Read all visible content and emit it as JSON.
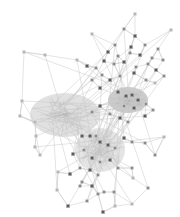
{
  "diagram": {
    "type": "network-graph",
    "background": "#ffffff",
    "edge_color": "#c8c8c8",
    "node_dark": "#5a5a5a",
    "node_mid": "#8a8a8a",
    "node_light": "#b4b4b4",
    "hub_clusters": [
      {
        "name": "left-dense",
        "cx": 65,
        "cy": 115,
        "rx": 35,
        "ry": 22,
        "shade": "#bdbdbd"
      },
      {
        "name": "right-dense",
        "cx": 128,
        "cy": 100,
        "rx": 20,
        "ry": 13,
        "shade": "#8f8f8f"
      },
      {
        "name": "bottom-dense",
        "cx": 100,
        "cy": 150,
        "rx": 25,
        "ry": 22,
        "shade": "#c4c4c4"
      }
    ],
    "nodes": [
      [
        135,
        14,
        "l"
      ],
      [
        124,
        29,
        "m"
      ],
      [
        135,
        36,
        "d"
      ],
      [
        171,
        30,
        "l"
      ],
      [
        92,
        34,
        "l"
      ],
      [
        115,
        45,
        "m"
      ],
      [
        131,
        47,
        "d"
      ],
      [
        145,
        45,
        "m"
      ],
      [
        158,
        49,
        "m"
      ],
      [
        108,
        52,
        "d"
      ],
      [
        118,
        56,
        "m"
      ],
      [
        130,
        53,
        "m"
      ],
      [
        140,
        55,
        "d"
      ],
      [
        152,
        58,
        "m"
      ],
      [
        163,
        60,
        "m"
      ],
      [
        104,
        61,
        "d"
      ],
      [
        114,
        64,
        "m"
      ],
      [
        124,
        62,
        "d"
      ],
      [
        136,
        67,
        "m"
      ],
      [
        148,
        64,
        "m"
      ],
      [
        156,
        70,
        "d"
      ],
      [
        96,
        68,
        "m"
      ],
      [
        87,
        66,
        "d"
      ],
      [
        77,
        60,
        "l"
      ],
      [
        45,
        55,
        "l"
      ],
      [
        24,
        52,
        "l"
      ],
      [
        102,
        75,
        "m"
      ],
      [
        110,
        80,
        "d"
      ],
      [
        120,
        76,
        "m"
      ],
      [
        134,
        73,
        "d"
      ],
      [
        146,
        80,
        "m"
      ],
      [
        155,
        83,
        "l"
      ],
      [
        164,
        76,
        "m"
      ],
      [
        92,
        80,
        "m"
      ],
      [
        100,
        88,
        "d"
      ],
      [
        118,
        92,
        "d"
      ],
      [
        126,
        96,
        "d"
      ],
      [
        132,
        95,
        "d"
      ],
      [
        138,
        100,
        "d"
      ],
      [
        124,
        106,
        "m"
      ],
      [
        134,
        108,
        "d"
      ],
      [
        146,
        104,
        "m"
      ],
      [
        153,
        110,
        "m"
      ],
      [
        100,
        106,
        "d"
      ],
      [
        92,
        112,
        "m"
      ],
      [
        110,
        114,
        "m"
      ],
      [
        120,
        118,
        "d"
      ],
      [
        128,
        122,
        "m"
      ],
      [
        145,
        116,
        "d"
      ],
      [
        22,
        101,
        "l"
      ],
      [
        20,
        116,
        "l"
      ],
      [
        35,
        122,
        "l"
      ],
      [
        36,
        136,
        "l"
      ],
      [
        35,
        147,
        "l"
      ],
      [
        40,
        155,
        "l"
      ],
      [
        82,
        136,
        "d"
      ],
      [
        90,
        136,
        "d"
      ],
      [
        96,
        136,
        "m"
      ],
      [
        100,
        142,
        "d"
      ],
      [
        108,
        145,
        "d"
      ],
      [
        115,
        148,
        "m"
      ],
      [
        124,
        138,
        "d"
      ],
      [
        132,
        142,
        "m"
      ],
      [
        145,
        143,
        "m"
      ],
      [
        155,
        155,
        "m"
      ],
      [
        164,
        137,
        "l"
      ],
      [
        73,
        154,
        "d"
      ],
      [
        84,
        150,
        "m"
      ],
      [
        92,
        158,
        "d"
      ],
      [
        100,
        162,
        "m"
      ],
      [
        110,
        160,
        "d"
      ],
      [
        118,
        168,
        "m"
      ],
      [
        80,
        168,
        "m"
      ],
      [
        90,
        170,
        "d"
      ],
      [
        98,
        175,
        "m"
      ],
      [
        70,
        174,
        "d"
      ],
      [
        82,
        182,
        "m"
      ],
      [
        92,
        186,
        "d"
      ],
      [
        98,
        194,
        "m"
      ],
      [
        80,
        186,
        "m"
      ],
      [
        132,
        168,
        "m"
      ],
      [
        133,
        178,
        "l"
      ],
      [
        148,
        188,
        "m"
      ],
      [
        58,
        172,
        "l"
      ],
      [
        57,
        190,
        "l"
      ],
      [
        68,
        206,
        "d"
      ],
      [
        87,
        201,
        "m"
      ],
      [
        104,
        192,
        "m"
      ],
      [
        114,
        192,
        "m"
      ],
      [
        132,
        204,
        "l"
      ],
      [
        103,
        212,
        "d"
      ],
      [
        115,
        206,
        "l"
      ]
    ],
    "hub": [
      110,
      120
    ]
  }
}
